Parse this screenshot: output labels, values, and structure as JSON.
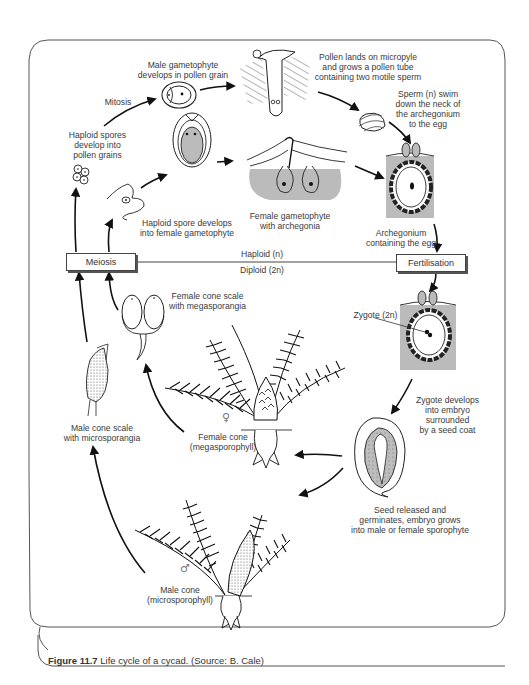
{
  "figure": {
    "caption_label": "Figure 11.7",
    "caption_text": " Life cycle of a cycad. (Source: B. Cale)",
    "title": "Life cycle of a cycad"
  },
  "boxes": {
    "meiosis": "Meiosis",
    "fertilisation": "Fertilisation"
  },
  "divider": {
    "haploid": "Haploid (n)",
    "diploid": "Diploid (2n)"
  },
  "labels": {
    "male_gametophyte": "Male gametophyte\ndevelops in pollen grain",
    "mitosis": "Mitosis",
    "pollen_lands": "Pollen lands on micropyle\nand grows a pollen tube\ncontaining two motile sperm",
    "sperm_swim": "Sperm (n) swim\ndown the neck of\nthe archegonium\nto the egg",
    "haploid_spores": "Haploid spores\ndevelop into\npollen grains",
    "haploid_spore_female": "Haploid spore develops\ninto female gametophyte",
    "female_gametophyte": "Female gametophyte\nwith archegonia",
    "archegonium": "Archegonium\ncontaining the egg",
    "female_cone_scale": "Female cone scale\nwith megasporangia",
    "zygote": "Zygote (2n)",
    "zygote_develops": "Zygote develops\ninto embryo\nsurrounded\nby a seed coat",
    "male_cone_scale": "Male cone scale\nwith microsporangia",
    "female_cone": "Female cone\n(megasporophyll)",
    "seed_released": "Seed released and\ngerminates, embryo grows\ninto male or female sporophyte",
    "male_cone": "Male cone\n(microsporophyll)"
  },
  "symbols": {
    "female": "♀",
    "male": "♂"
  },
  "colors": {
    "line": "#1a1a1a",
    "tissue_gray": "#b8b8b8",
    "frame": "#555555"
  }
}
